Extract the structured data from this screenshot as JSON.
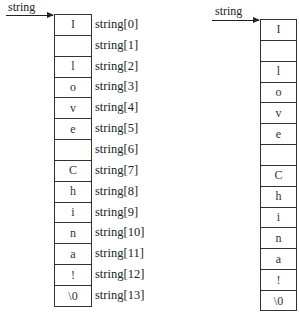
{
  "left_diagram": {
    "pointer_label": "string",
    "cells": [
      "I",
      "",
      "l",
      "o",
      "v",
      "e",
      "",
      "C",
      "h",
      "i",
      "n",
      "a",
      "!",
      "\\0"
    ],
    "index_labels": [
      "string[0]",
      "string[1]",
      "string[2]",
      "string[3]",
      "string[4]",
      "string[5]",
      "string[6]",
      "string[7]",
      "string[8]",
      "string[9]",
      "string[10]",
      "string[11]",
      "string[12]",
      "string[13]"
    ]
  },
  "right_diagram": {
    "pointer_label": "string",
    "cells": [
      "I",
      "",
      "l",
      "o",
      "v",
      "e",
      "",
      "C",
      "h",
      "i",
      "n",
      "a",
      "!",
      "\\0"
    ]
  },
  "colors": {
    "line": "#333333",
    "text": "#222222",
    "background": "#ffffff"
  }
}
